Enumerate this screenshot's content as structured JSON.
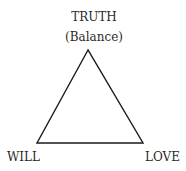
{
  "diagram": {
    "shape": "triangle",
    "vertices": {
      "top": {
        "label": "TRUTH",
        "sublabel": "(Balance)"
      },
      "bottom_left": {
        "label": "WILL"
      },
      "bottom_right": {
        "label": "LOVE"
      }
    },
    "stroke_color": "#1a1a1a"
  }
}
